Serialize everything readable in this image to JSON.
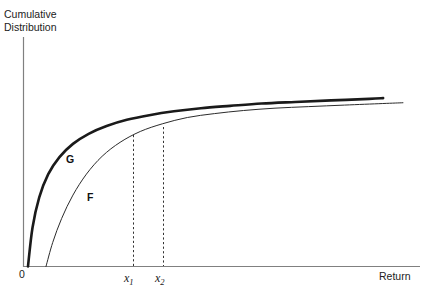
{
  "chart_data": {
    "type": "line",
    "title": "",
    "xlabel": "Return",
    "ylabel": "Cumulative Distribution",
    "ylabel_line1": "Cumulative",
    "ylabel_line2": "Distribution",
    "origin_label": "0",
    "grid": false,
    "legend_position": "inline-curve-labels",
    "xlim": [
      0,
      1
    ],
    "ylim": [
      0,
      1
    ],
    "annotations": [
      {
        "name": "x1",
        "text": "x",
        "subscript": "1",
        "type": "dashed-vertical-line"
      },
      {
        "name": "x2",
        "text": "x",
        "subscript": "2",
        "type": "dashed-vertical-line"
      }
    ],
    "series": [
      {
        "name": "G",
        "label": "G",
        "style": "thick",
        "color": "#1a1a1a",
        "width": 2.6,
        "points": [
          [
            0.0113,
            0.0
          ],
          [
            0.0227,
            0.2174
          ],
          [
            0.0397,
            0.387
          ],
          [
            0.0624,
            0.5174
          ],
          [
            0.0907,
            0.613
          ],
          [
            0.1247,
            0.687
          ],
          [
            0.1643,
            0.7435
          ],
          [
            0.2096,
            0.787
          ],
          [
            0.2606,
            0.8217
          ],
          [
            0.3172,
            0.8478
          ],
          [
            0.3795,
            0.8696
          ],
          [
            0.4474,
            0.887
          ],
          [
            0.521,
            0.9
          ],
          [
            0.6003,
            0.913
          ],
          [
            0.6852,
            0.9217
          ],
          [
            0.7758,
            0.9304
          ],
          [
            0.872,
            0.9391
          ],
          [
            0.907,
            0.9435
          ]
        ]
      },
      {
        "name": "F",
        "label": "F",
        "style": "thin",
        "color": "#2b2b2b",
        "width": 1.0,
        "points": [
          [
            0.0567,
            0.0
          ],
          [
            0.0737,
            0.1348
          ],
          [
            0.0963,
            0.2696
          ],
          [
            0.1247,
            0.4
          ],
          [
            0.1587,
            0.5174
          ],
          [
            0.1983,
            0.6174
          ],
          [
            0.2436,
            0.6957
          ],
          [
            0.2946,
            0.7565
          ],
          [
            0.3512,
            0.8
          ],
          [
            0.4134,
            0.8348
          ],
          [
            0.4814,
            0.8565
          ],
          [
            0.555,
            0.8739
          ],
          [
            0.6343,
            0.887
          ],
          [
            0.7192,
            0.8957
          ],
          [
            0.8098,
            0.9043
          ],
          [
            0.906,
            0.913
          ],
          [
            0.957,
            0.9174
          ]
        ]
      }
    ],
    "xticks": [
      {
        "value": 0.28,
        "label": "x",
        "sub": "1"
      },
      {
        "value": 0.355,
        "label": "x",
        "sub": "2"
      }
    ]
  }
}
